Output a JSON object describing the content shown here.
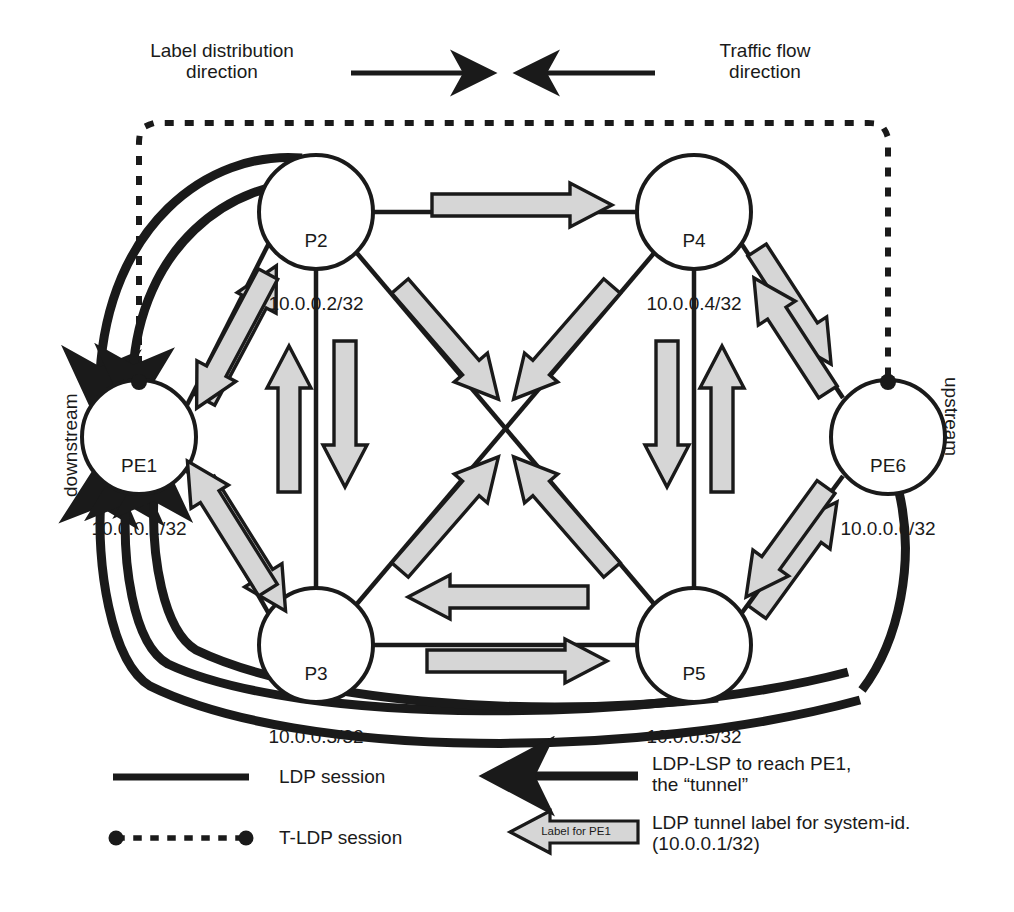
{
  "diagram": {
    "title_top_left": "Label distribution\ndirection",
    "title_top_right": "Traffic flow\ndirection",
    "side_label_left": "downstream",
    "side_label_right": "upstream"
  },
  "nodes": [
    {
      "id": "pe1",
      "name": "PE1",
      "address": "10.0.0.1/32",
      "cx": 139,
      "cy": 437,
      "r": 57,
      "tldp_endpoint": true
    },
    {
      "id": "p2",
      "name": "P2",
      "address": "10.0.0.2/32",
      "cx": 316,
      "cy": 212,
      "r": 57,
      "tldp_endpoint": false
    },
    {
      "id": "p4",
      "name": "P4",
      "address": "10.0.0.4/32",
      "cx": 694,
      "cy": 212,
      "r": 57,
      "tldp_endpoint": false
    },
    {
      "id": "pe6",
      "name": "PE6",
      "address": "10.0.0.6/32",
      "cx": 888,
      "cy": 437,
      "r": 57,
      "tldp_endpoint": true
    },
    {
      "id": "p5",
      "name": "P5",
      "address": "10.0.0.5/32",
      "cx": 694,
      "cy": 645,
      "r": 57,
      "tldp_endpoint": false
    },
    {
      "id": "p3",
      "name": "P3",
      "address": "10.0.0.3/32",
      "cx": 316,
      "cy": 645,
      "r": 57,
      "tldp_endpoint": false
    }
  ],
  "legend": {
    "items": [
      {
        "key": "ldp-session",
        "label": "LDP session"
      },
      {
        "key": "tldp-session",
        "label": "T-LDP session"
      },
      {
        "key": "ldp-lsp",
        "label": "LDP-LSP to reach PE1,\nthe “tunnel”"
      },
      {
        "key": "tunnel-label",
        "label": "LDP tunnel label for system-id.\n(10.0.0.1/32)",
        "chip": "Label for PE1"
      }
    ]
  },
  "colors": {
    "ink": "#1a1a1a",
    "arrow_fill": "#d6d6d6",
    "arrow_stroke": "#1a1a1a",
    "background": "#ffffff"
  }
}
